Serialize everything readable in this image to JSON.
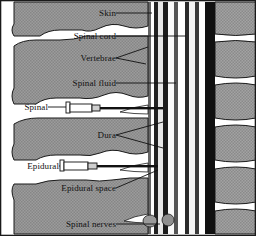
{
  "figure": {
    "type": "anatomical-diagram",
    "border_color": "#1a1a1a",
    "background_color": "#ffffff",
    "bone_fill": "#9a9a9a",
    "line_color": "#111111"
  },
  "labels": [
    {
      "id": "skin",
      "text": "Skin",
      "x": 112,
      "y": 13,
      "align": "right",
      "leader_to_x": 152,
      "leader_to_y": 17
    },
    {
      "id": "spinal-cord",
      "text": "Spinal cord",
      "x": 112,
      "y": 36,
      "align": "right",
      "leader_to_x": 183,
      "leader_to_y": 40
    },
    {
      "id": "vertebrae",
      "text": "Vertebrae",
      "x": 112,
      "y": 60,
      "align": "right",
      "leader_to_x": 146,
      "leader_to_y": 52
    },
    {
      "id": "spinal-fluid",
      "text": "Spinal fluid",
      "x": 112,
      "y": 83,
      "align": "right",
      "leader_to_x": 176,
      "leader_to_y": 87
    },
    {
      "id": "spinal",
      "text": "Spinal",
      "x": 46,
      "y": 107,
      "align": "right",
      "leader_to_x": 68,
      "leader_to_y": 110
    },
    {
      "id": "dura",
      "text": "Dura",
      "x": 112,
      "y": 137,
      "align": "right",
      "leader_to_x": 172,
      "leader_to_y": 128
    },
    {
      "id": "epidural",
      "text": "Epidural",
      "x": 57,
      "y": 166,
      "align": "right",
      "leader_to_x": 64,
      "leader_to_y": 168
    },
    {
      "id": "epidural-space",
      "text": "Epidural space",
      "x": 112,
      "y": 190,
      "align": "right",
      "leader_to_x": 158,
      "leader_to_y": 168
    },
    {
      "id": "spinal-nerves",
      "text": "Spinal nerves",
      "x": 112,
      "y": 224,
      "align": "right",
      "leader_to_x": 160,
      "leader_to_y": 227
    }
  ],
  "needles": [
    {
      "id": "spinal-needle",
      "label_ref": "spinal",
      "barrel_x": 68,
      "barrel_y": 103,
      "tip_x": 163,
      "tip_y": 110
    },
    {
      "id": "epidural-needle",
      "label_ref": "epidural",
      "barrel_x": 62,
      "barrel_y": 161,
      "tip_x": 155,
      "tip_y": 168
    }
  ],
  "structures": [
    {
      "id": "skin-surface",
      "name": "Skin surface line"
    },
    {
      "id": "spinous-processes",
      "name": "Spinous processes (left column)"
    },
    {
      "id": "dura-mater",
      "name": "Dura mater"
    },
    {
      "id": "subarachnoid-space",
      "name": "Spinal fluid / subarachnoid space"
    },
    {
      "id": "spinal-cord-body",
      "name": "Spinal cord"
    },
    {
      "id": "vertebral-bodies",
      "name": "Vertebral bodies (right column)"
    },
    {
      "id": "intervertebral-disc",
      "name": "Intervertebral discs"
    },
    {
      "id": "epidural-space-band",
      "name": "Epidural space"
    },
    {
      "id": "spinal-nerve-roots",
      "name": "Spinal nerve roots"
    }
  ]
}
